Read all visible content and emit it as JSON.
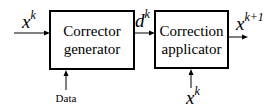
{
  "diagram": {
    "blocks": [
      {
        "id": "corrector-generator",
        "lines": [
          "Corrector",
          "generator"
        ]
      },
      {
        "id": "correction-applicator",
        "lines": [
          "Correction",
          "applicator"
        ]
      }
    ],
    "signals": {
      "input": {
        "base": "x",
        "sup": "k"
      },
      "intermediate": {
        "base": "d",
        "sup": "k"
      },
      "output": {
        "base": "x",
        "sup": "k+1"
      },
      "data_label": "Data",
      "side_input": {
        "base": "x",
        "sup": "k"
      }
    },
    "edges": [
      {
        "from": "input",
        "to": "corrector-generator"
      },
      {
        "from": "data",
        "to": "corrector-generator"
      },
      {
        "from": "corrector-generator",
        "to": "correction-applicator",
        "label": "d^k"
      },
      {
        "from": "side-input",
        "to": "correction-applicator"
      },
      {
        "from": "correction-applicator",
        "to": "output"
      }
    ]
  }
}
